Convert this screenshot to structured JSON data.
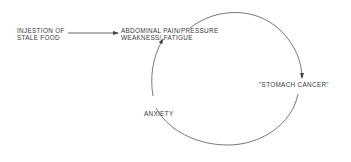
{
  "diagram": {
    "nodes": {
      "trigger": {
        "line1": "INJESTION OF",
        "line2": "STALE FOOD"
      },
      "symptoms": {
        "line1": "ABDOMINAL PAIN/PRESSURE",
        "line2": "WEAKNESS/ FATIGUE"
      },
      "belief": {
        "label": "\"STOMACH CANCER\""
      },
      "anxiety": {
        "label": "ANXIETY"
      }
    },
    "edges": [
      {
        "from": "trigger",
        "to": "symptoms",
        "type": "straight-arrow"
      },
      {
        "from": "symptoms",
        "to": "belief",
        "type": "arc-arrow"
      },
      {
        "from": "belief",
        "to": "anxiety",
        "type": "arc"
      },
      {
        "from": "anxiety",
        "to": "symptoms",
        "type": "arc-arrow"
      }
    ],
    "colors": {
      "line": "#555555",
      "text": "#3a3a3a"
    }
  }
}
